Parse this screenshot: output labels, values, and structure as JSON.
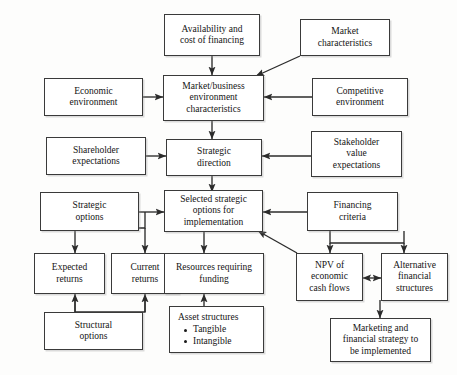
{
  "diagram": {
    "type": "flowchart",
    "line_color": "#3a3a3a",
    "box_fill": "#ffffff",
    "text_color": "#141414"
  },
  "nodes": {
    "availability_cost_financing": "Availability and\ncost of financing",
    "market_characteristics": "Market\ncharacteristics",
    "economic_environment": "Economic\nenvironment",
    "market_business_environment": "Market/business\nenvironment\ncharacteristics",
    "competitive_environment": "Competitive\nenvironment",
    "shareholder_expectations": "Shareholder\nexpectations",
    "strategic_direction": "Strategic\ndirection",
    "stakeholder_value_expectations": "Stakeholder\nvalue\nexpectations",
    "strategic_options": "Strategic\noptions",
    "selected_strategic_options": "Selected strategic\noptions for\nimplementation",
    "financing_criteria": "Financing\ncriteria",
    "expected_returns": "Expected\nreturns",
    "current_returns": "Current\nreturns",
    "resources_requiring_funding": "Resources requiring\nfunding",
    "npv_economic_cash_flows": "NPV of\neconomic\ncash flows",
    "alternative_financial_structures": "Alternative\nfinancial\nstructures",
    "structural_options": "Structural\noptions",
    "asset_structures": "Asset structures",
    "asset_structures_bullets": [
      "Tangible",
      "Intangible"
    ],
    "marketing_financial_strategy": "Marketing and\nfinancial strategy to\nbe implemented"
  }
}
